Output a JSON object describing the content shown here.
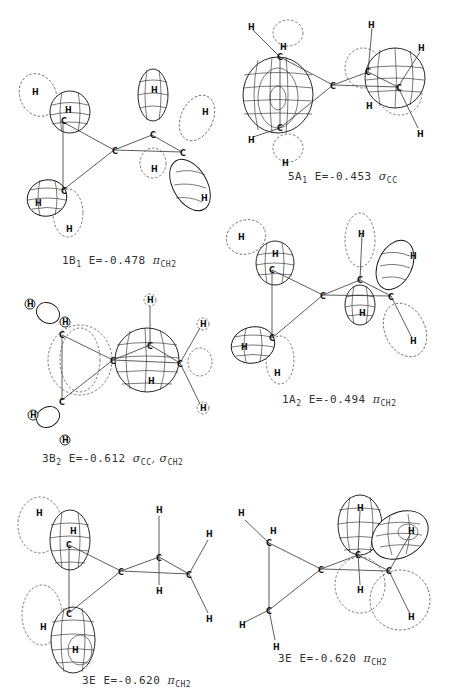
{
  "figure": {
    "atom_labels": {
      "carbon": "C",
      "hydrogen": "H"
    },
    "panels": [
      {
        "id": "1B1",
        "symmetry": "1B",
        "symmetry_sub": "1",
        "energy_text": "E=-0.478",
        "orbital_char": "π",
        "orbital_sub": "CH2"
      },
      {
        "id": "5A1",
        "symmetry": "5A",
        "symmetry_sub": "1",
        "energy_text": "E=-0.453",
        "orbital_char": "σ",
        "orbital_sub": "CC"
      },
      {
        "id": "1A2",
        "symmetry": "1A",
        "symmetry_sub": "2",
        "energy_text": "E=-0.494",
        "orbital_char": "π",
        "orbital_sub": "CH2"
      },
      {
        "id": "3B2",
        "symmetry": "3B",
        "symmetry_sub": "2",
        "energy_text": "E=-0.612",
        "orbital_char": "σ",
        "orbital_sub": "CC",
        "orbital_char2": ", σ",
        "orbital_sub2": "CH2"
      },
      {
        "id": "3E-a",
        "symmetry": "3E",
        "symmetry_sub": "",
        "energy_text": "E=-0.620",
        "orbital_char": "π",
        "orbital_sub": "CH2"
      },
      {
        "id": "3E-b",
        "symmetry": "3E",
        "symmetry_sub": "",
        "energy_text": "E=-0.620",
        "orbital_char": "π",
        "orbital_sub": "CH2"
      }
    ]
  }
}
